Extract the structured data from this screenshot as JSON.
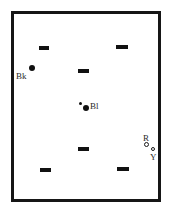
{
  "figure": {
    "type": "schematic-diagram",
    "title": "",
    "background_color": "#ffffff",
    "width": 172,
    "height": 216
  },
  "arena": {
    "name": "arena-frame",
    "shape": "rectangle",
    "x": 11,
    "y": 11,
    "width": 150,
    "height": 191,
    "border_width": 3,
    "border_color": "#161616",
    "fill_color": "#ffffff"
  },
  "dash_markers": [
    {
      "id": "dash-top-left",
      "x": 39,
      "y": 46,
      "width": 10,
      "height": 4,
      "color": "#111111"
    },
    {
      "id": "dash-top-right",
      "x": 116,
      "y": 45,
      "width": 12,
      "height": 4,
      "color": "#111111"
    },
    {
      "id": "dash-mid-upper",
      "x": 78,
      "y": 69,
      "width": 11,
      "height": 4,
      "color": "#111111"
    },
    {
      "id": "dash-mid-lower",
      "x": 78,
      "y": 147,
      "width": 11,
      "height": 4,
      "color": "#111111"
    },
    {
      "id": "dash-bottom-left",
      "x": 40,
      "y": 168,
      "width": 11,
      "height": 4,
      "color": "#111111"
    },
    {
      "id": "dash-bottom-right",
      "x": 117,
      "y": 167,
      "width": 12,
      "height": 4,
      "color": "#111111"
    }
  ],
  "points": [
    {
      "id": "point-bk",
      "label": "Bk",
      "label_x": 16,
      "label_y": 72,
      "dot_x": 29,
      "dot_y": 65,
      "dot_size": 6,
      "style": "filled",
      "color": "#101010"
    },
    {
      "id": "point-bl-small",
      "label": "",
      "dot_x": 79,
      "dot_y": 102,
      "dot_size": 3,
      "style": "filled",
      "color": "#101010"
    },
    {
      "id": "point-bl",
      "label": "Bl",
      "label_x": 90,
      "label_y": 102,
      "dot_x": 83,
      "dot_y": 105,
      "dot_size": 6,
      "style": "filled",
      "color": "#101010"
    },
    {
      "id": "point-r",
      "label": "R",
      "label_x": 143,
      "label_y": 134,
      "dot_x": 144,
      "dot_y": 142,
      "dot_size": 5,
      "style": "open",
      "color": "#1a1a1a"
    },
    {
      "id": "point-y",
      "label": "Y",
      "label_x": 150,
      "label_y": 153,
      "dot_x": 151,
      "dot_y": 147,
      "dot_size": 4,
      "style": "open",
      "color": "#1a1a1a"
    }
  ]
}
